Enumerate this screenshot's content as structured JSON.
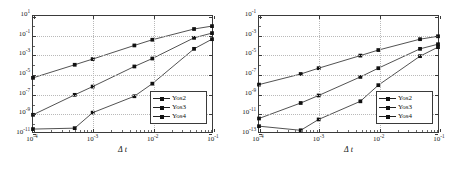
{
  "figure": {
    "panels": [
      "left",
      "right"
    ]
  },
  "chart_data": [
    {
      "type": "line",
      "panel": "left",
      "title": "",
      "xlabel": "Δ t",
      "ylabel": "",
      "xscale": "log",
      "yscale": "log",
      "xlim": [
        0.0001,
        0.1
      ],
      "ylim": [
        1e-11,
        10
      ],
      "grid": true,
      "legend_position": "lower right",
      "xticks": [
        0.0001,
        0.001,
        0.01,
        0.1
      ],
      "xticklabels": [
        "10-4",
        "10-3",
        "10-2",
        "10-1"
      ],
      "xtick_mantissas": [
        "10",
        "10",
        "10",
        "10"
      ],
      "xtick_exponents": [
        "-4",
        "-3",
        "-2",
        "-1"
      ],
      "yticks": [
        10,
        0.1,
        0.001,
        1e-05,
        1e-07,
        1e-09,
        1e-11
      ],
      "ytick_mantissas": [
        "10",
        "10",
        "10",
        "10",
        "10",
        "10",
        "10"
      ],
      "ytick_exponents": [
        "1",
        "-1",
        "-3",
        "-5",
        "-7",
        "-9",
        "-11"
      ],
      "x": [
        0.0001,
        0.0005,
        0.001,
        0.005,
        0.01,
        0.05,
        0.1
      ],
      "series": [
        {
          "name": "Yos2",
          "values": [
            4e-06,
            9e-05,
            0.00035,
            0.009,
            0.035,
            0.45,
            0.9
          ]
        },
        {
          "name": "Yos3",
          "values": [
            6e-10,
            7e-08,
            5e-07,
            6e-05,
            0.0004,
            0.055,
            0.17
          ]
        },
        {
          "name": "Yos4",
          "values": [
            2e-11,
            2.5e-11,
            1e-09,
            5e-08,
            1e-06,
            0.004,
            0.04
          ]
        }
      ]
    },
    {
      "type": "line",
      "panel": "right",
      "title": "",
      "xlabel": "Δ t",
      "ylabel": "",
      "xscale": "log",
      "yscale": "log",
      "xlim": [
        0.0001,
        0.1
      ],
      "ylim": [
        1e-13,
        0.1
      ],
      "grid": true,
      "legend_position": "lower right",
      "xticks": [
        0.0001,
        0.001,
        0.01,
        0.1
      ],
      "xtick_mantissas": [
        "10",
        "10",
        "10",
        "10"
      ],
      "xtick_exponents": [
        "-4",
        "-3",
        "-2",
        "-1"
      ],
      "yticks": [
        0.1,
        0.001,
        1e-05,
        1e-07,
        1e-09,
        1e-11,
        1e-13
      ],
      "ytick_mantissas": [
        "10",
        "10",
        "10",
        "10",
        "10",
        "10",
        "10"
      ],
      "ytick_exponents": [
        "-1",
        "-3",
        "-5",
        "-7",
        "-9",
        "-11",
        "-13"
      ],
      "x": [
        0.0001,
        0.0005,
        0.001,
        0.005,
        0.01,
        0.05,
        0.1
      ],
      "series": [
        {
          "name": "Yos2",
          "values": [
            8e-09,
            1e-07,
            4e-07,
            8e-06,
            3e-05,
            0.0004,
            0.0008
          ]
        },
        {
          "name": "Yos3",
          "values": [
            2.5e-12,
            1e-10,
            6e-10,
            5e-08,
            4e-07,
            4e-05,
            0.00012
          ]
        },
        {
          "name": "Yos4",
          "values": [
            4e-13,
            1.5e-13,
            2e-12,
            1.5e-10,
            7e-09,
            7e-06,
            6e-05
          ]
        }
      ]
    }
  ],
  "legend": {
    "entries": [
      "Yos2",
      "Yos3",
      "Yos4"
    ]
  },
  "colors": {
    "axis": "#3a3a3a",
    "grid": "#b9b9b9",
    "line": "#222222",
    "marker": "#111111",
    "background": "#ffffff"
  }
}
